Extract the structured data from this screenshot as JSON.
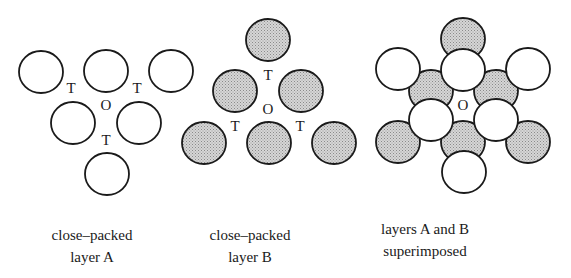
{
  "colors": {
    "stroke": "#1a1a1a",
    "shade": "#c4c4c4",
    "open": "#ffffff",
    "label": "#1a1a1a"
  },
  "circle_radius": 22,
  "panels": [
    {
      "id": "layer-a",
      "caption": [
        "close–packed",
        "layer A"
      ],
      "caption_center_x": 92,
      "caption_top": 224,
      "circles": [
        {
          "x": 41,
          "y": 72,
          "fill": "open"
        },
        {
          "x": 106,
          "y": 71,
          "fill": "open"
        },
        {
          "x": 171,
          "y": 71,
          "fill": "open"
        },
        {
          "x": 73,
          "y": 123,
          "fill": "open"
        },
        {
          "x": 139,
          "y": 123,
          "fill": "open"
        },
        {
          "x": 107,
          "y": 174,
          "fill": "open"
        }
      ],
      "labels": [
        {
          "text": "T",
          "x": 71,
          "y": 93
        },
        {
          "text": "T",
          "x": 137,
          "y": 93
        },
        {
          "text": "O",
          "x": 106,
          "y": 110
        },
        {
          "text": "T",
          "x": 106,
          "y": 145
        }
      ]
    },
    {
      "id": "layer-b",
      "caption": [
        "close–packed",
        "layer B"
      ],
      "caption_center_x": 250,
      "caption_top": 224,
      "circles": [
        {
          "x": 268,
          "y": 40,
          "fill": "shade"
        },
        {
          "x": 235,
          "y": 91,
          "fill": "shade"
        },
        {
          "x": 301,
          "y": 91,
          "fill": "shade"
        },
        {
          "x": 204,
          "y": 143,
          "fill": "shade"
        },
        {
          "x": 269,
          "y": 143,
          "fill": "shade"
        },
        {
          "x": 334,
          "y": 143,
          "fill": "shade"
        }
      ],
      "labels": [
        {
          "text": "T",
          "x": 268,
          "y": 80
        },
        {
          "text": "O",
          "x": 268,
          "y": 114
        },
        {
          "text": "T",
          "x": 235,
          "y": 131
        },
        {
          "text": "T",
          "x": 300,
          "y": 131
        }
      ]
    },
    {
      "id": "superimposed",
      "caption": [
        "layers A and B",
        "superimposed"
      ],
      "caption_center_x": 425,
      "caption_top": 218,
      "circles": [
        {
          "x": 463,
          "y": 39,
          "fill": "shade"
        },
        {
          "x": 431,
          "y": 91,
          "fill": "shade"
        },
        {
          "x": 496,
          "y": 91,
          "fill": "shade"
        },
        {
          "x": 398,
          "y": 142,
          "fill": "shade"
        },
        {
          "x": 463,
          "y": 142,
          "fill": "shade"
        },
        {
          "x": 528,
          "y": 142,
          "fill": "shade"
        },
        {
          "x": 398,
          "y": 69,
          "fill": "open"
        },
        {
          "x": 463,
          "y": 70,
          "fill": "open"
        },
        {
          "x": 528,
          "y": 69,
          "fill": "open"
        },
        {
          "x": 431,
          "y": 120,
          "fill": "open"
        },
        {
          "x": 496,
          "y": 120,
          "fill": "open"
        },
        {
          "x": 464,
          "y": 172,
          "fill": "open"
        }
      ],
      "labels": [
        {
          "text": "O",
          "x": 463,
          "y": 110
        }
      ]
    }
  ]
}
